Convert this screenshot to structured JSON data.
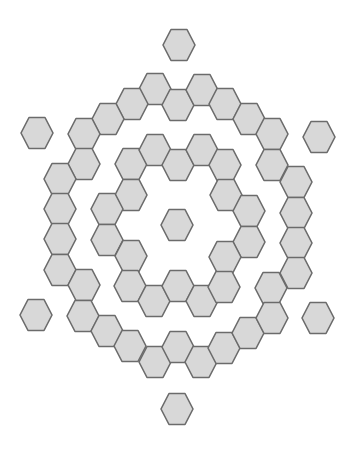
{
  "diagram": {
    "fill_color": "#d8d8d8",
    "stroke_color": "#6b6b6b",
    "groups": [
      {
        "name": "center",
        "hexagons": [
          [
            177,
            225
          ]
        ]
      },
      {
        "name": "inner-ring",
        "hexagons": [
          [
            131,
            164
          ],
          [
            155,
            150
          ],
          [
            178,
            165
          ],
          [
            202,
            150
          ],
          [
            225,
            165
          ],
          [
            131,
            195
          ],
          [
            107,
            209
          ],
          [
            107,
            240
          ],
          [
            131,
            256
          ],
          [
            226,
            195
          ],
          [
            249,
            211
          ],
          [
            249,
            242
          ],
          [
            225,
            257
          ],
          [
            130,
            286
          ],
          [
            154,
            301
          ],
          [
            178,
            286
          ],
          [
            202,
            301
          ],
          [
            224,
            287
          ]
        ]
      },
      {
        "name": "outer-ring",
        "hexagons": [
          [
            155,
            89
          ],
          [
            178,
            105
          ],
          [
            202,
            90
          ],
          [
            132,
            104
          ],
          [
            108,
            119
          ],
          [
            84,
            134
          ],
          [
            225,
            104
          ],
          [
            249,
            119
          ],
          [
            272,
            134
          ],
          [
            84,
            164
          ],
          [
            60,
            179
          ],
          [
            60,
            209
          ],
          [
            60,
            239
          ],
          [
            60,
            270
          ],
          [
            84,
            285
          ],
          [
            272,
            165
          ],
          [
            296,
            182
          ],
          [
            296,
            213
          ],
          [
            296,
            243
          ],
          [
            296,
            273
          ],
          [
            271,
            288
          ],
          [
            83,
            316
          ],
          [
            107,
            331
          ],
          [
            130,
            346
          ],
          [
            155,
            362
          ],
          [
            178,
            347
          ],
          [
            201,
            362
          ],
          [
            224,
            348
          ],
          [
            248,
            333
          ],
          [
            272,
            318
          ]
        ]
      },
      {
        "name": "outliers",
        "hexagons": [
          [
            179,
            45
          ],
          [
            37,
            133
          ],
          [
            319,
            137
          ],
          [
            36,
            315
          ],
          [
            318,
            318
          ],
          [
            177,
            409
          ]
        ]
      }
    ]
  }
}
